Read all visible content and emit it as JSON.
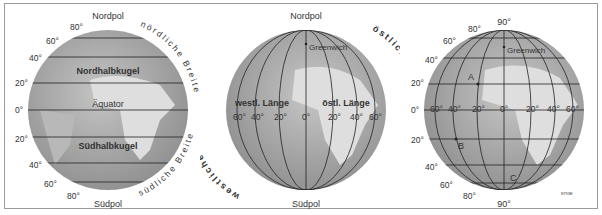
{
  "panels": [
    {
      "name": "latitude",
      "top_label": "Nordpol",
      "bottom_label": "Südpol",
      "north_hemisphere": "Nordhalbkugel",
      "south_hemisphere": "Südhalbkugel",
      "equator": "Äquator",
      "arc_north": "nördliche Breite",
      "arc_south": "südliche Breite",
      "lat_labels": [
        "80°",
        "60°",
        "40°",
        "20°",
        "0°",
        "20°",
        "40°",
        "60°",
        "80°"
      ]
    },
    {
      "name": "longitude",
      "top_label": "Nordpol",
      "bottom_label": "Südpol",
      "greenwich": "Greenwich",
      "west_label": "westl. Länge",
      "east_label": "östl. Länge",
      "arc_west": "westliche Halbkugel",
      "arc_east": "östliche Halbkugel",
      "lon_labels": [
        "60°",
        "40°",
        "20°",
        "0°",
        "20°",
        "40°",
        "60°"
      ]
    },
    {
      "name": "grid",
      "top_label": "90°",
      "bottom_label": "90°",
      "greenwich": "Greenwich",
      "points": [
        "A",
        "B",
        "C"
      ],
      "lat_labels": [
        "80°",
        "60°",
        "40°",
        "20°",
        "0°",
        "20°",
        "40°",
        "60°",
        "80°"
      ],
      "lon_labels": [
        "60°",
        "40°",
        "20°",
        "0°",
        "20°",
        "40°",
        "60°"
      ],
      "code": "8793E"
    }
  ],
  "colors": {
    "globe": "#a9a9a9",
    "land": "#dcdcdc",
    "lines": "#2a2a2a",
    "frame": "#9a9a9a"
  }
}
